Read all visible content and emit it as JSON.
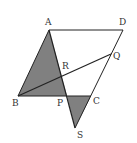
{
  "diagram": {
    "type": "geometry",
    "fill_color": "#808080",
    "stroke_color": "#222222",
    "points": {
      "A": {
        "label": "A",
        "x": 49,
        "y": 30
      },
      "D": {
        "label": "D",
        "x": 123,
        "y": 30
      },
      "Q": {
        "label": "Q",
        "x": 111,
        "y": 54
      },
      "R": {
        "label": "R",
        "x": 62,
        "y": 78
      },
      "B": {
        "label": "B",
        "x": 18,
        "y": 96
      },
      "P": {
        "label": "P",
        "x": 67,
        "y": 96
      },
      "C": {
        "label": "C",
        "x": 91,
        "y": 96
      },
      "S": {
        "label": "S",
        "x": 75,
        "y": 128
      }
    },
    "shaded_regions": [
      "triangle ABP",
      "triangle PCS"
    ],
    "segments": [
      "AD",
      "DC",
      "CS",
      "AB",
      "BC",
      "AS",
      "BQ"
    ]
  }
}
